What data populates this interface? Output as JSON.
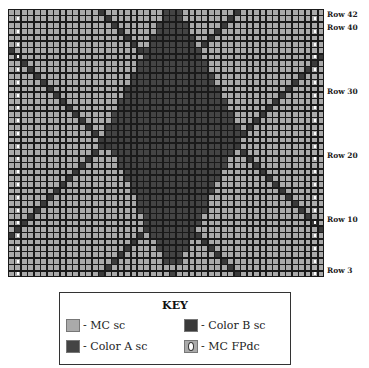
{
  "chart_data": {
    "type": "table",
    "grid": {
      "columns": 49,
      "rows": 42,
      "first_row_label": 3,
      "diamond": {
        "center_col": 25,
        "widest_row_index": 19,
        "half_width": 10,
        "top_row_index": 0,
        "bottom_row_index": 40
      },
      "diagonals": [
        {
          "start_col_top": 14,
          "direction": "down-right"
        },
        {
          "start_col_top": 35,
          "direction": "down-left"
        },
        {
          "start_col_bottom": 14,
          "direction": "up-right"
        },
        {
          "start_col_bottom": 35,
          "direction": "up-left"
        }
      ],
      "fpdc_marker_columns": [
        1,
        47
      ],
      "fpdc_marker_rows": "even rows"
    },
    "row_labels": [
      "Row 42",
      "Row 40",
      "Row 30",
      "Row 20",
      "Row 10",
      "Row 3"
    ]
  },
  "colors": {
    "mc": "#aaaaaa",
    "color_a": "#444444",
    "color_b": "#3a3a3a",
    "grid_line": "#1a1a1a",
    "marker": "#ffffff"
  },
  "key": {
    "title": "KEY",
    "items": [
      {
        "label": "- MC sc",
        "swatch": "mc"
      },
      {
        "label": "- Color B sc",
        "swatch": "color_b"
      },
      {
        "label": "- Color A sc",
        "swatch": "color_a"
      },
      {
        "label": "- MC FPdc",
        "swatch": "fpdc"
      }
    ]
  }
}
